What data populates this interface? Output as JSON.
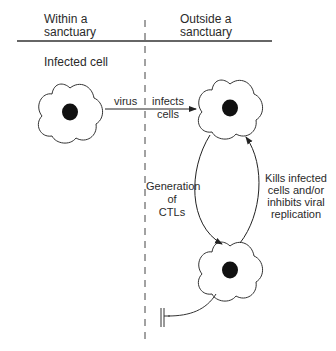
{
  "header": {
    "left_title_line1": "Within a",
    "left_title_line2": "sanctuary",
    "right_title_line1": "Outside a",
    "right_title_line2": "sanctuary"
  },
  "labels": {
    "infected_cell": "Infected cell",
    "virus": "virus",
    "infects_line1": "infects",
    "infects_line2": "cells",
    "generation_line1": "Generation",
    "generation_line2": "of",
    "generation_line3": "CTLs",
    "kills_line1": "Kills infected",
    "kills_line2": "cells and/or",
    "kills_line3": "inhibits viral",
    "kills_line4": "replication"
  },
  "nodes": [
    {
      "id": "infected-cell-sanctuary",
      "x": 70,
      "y": 112
    },
    {
      "id": "infected-cell-outside",
      "x": 230,
      "y": 108
    },
    {
      "id": "ctl-cell",
      "x": 230,
      "y": 270
    }
  ],
  "colors": {
    "line": "#333333",
    "nucleus": "#111111",
    "background": "#ffffff"
  }
}
